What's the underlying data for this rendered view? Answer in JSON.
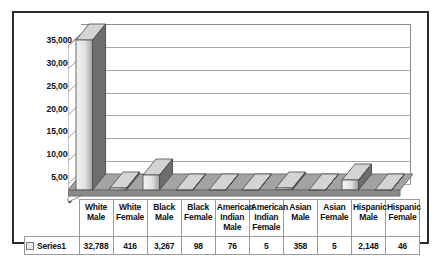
{
  "chart_data": {
    "type": "bar",
    "title": "",
    "subtitle": "",
    "xlabel": "",
    "ylabel": "",
    "ylim": [
      0,
      35000
    ],
    "ytick_step": 5000,
    "grid": true,
    "legend_position": "data-table-row",
    "style": "3d-column",
    "categories": [
      "White Male",
      "White Female",
      "Black Male",
      "Black Female",
      "American Indian Male",
      "American Indian Female",
      "Asian Male",
      "Asian Female",
      "Hispanic Male",
      "Hispanic Female"
    ],
    "category_lines": [
      [
        "White",
        "Male"
      ],
      [
        "White",
        "Female"
      ],
      [
        "Black",
        "Male"
      ],
      [
        "Black",
        "Female"
      ],
      [
        "American",
        "Indian",
        "Male"
      ],
      [
        "American",
        "Indian",
        "Female"
      ],
      [
        "Asian",
        "Male"
      ],
      [
        "Asian",
        "Female"
      ],
      [
        "Hispanic",
        "Male"
      ],
      [
        "Hispanic",
        "Female"
      ]
    ],
    "series": [
      {
        "name": "Series1",
        "values": [
          32788,
          416,
          3267,
          98,
          76,
          5,
          358,
          5,
          2148,
          46
        ],
        "value_labels": [
          "32,788",
          "416",
          "3,267",
          "98",
          "76",
          "5",
          "358",
          "5",
          "2,148",
          "46"
        ]
      }
    ],
    "ytick_labels": [
      "35,000",
      "30,000",
      "25,000",
      "20,000",
      "15,000",
      "10,000",
      "5,000",
      "0"
    ],
    "ytick_values": [
      35000,
      30000,
      25000,
      20000,
      15000,
      10000,
      5000,
      0
    ]
  },
  "colors": {
    "frame_border": "#2b2b2b",
    "plot_background": "#ffffff",
    "gridline": "#a8a8a8",
    "floor_top": "#a3a3a3",
    "floor_front": "#8a8a8a",
    "bar_front_light": "#f2f2f2",
    "bar_front_dark": "#9e9e9e",
    "bar_side": "#6e6e6e",
    "bar_top": "#d4d4d4",
    "table_border": "#9a9a9a",
    "text": "#111111"
  },
  "legend": {
    "series_label": "Series1",
    "swatch_name": "series1-swatch"
  }
}
